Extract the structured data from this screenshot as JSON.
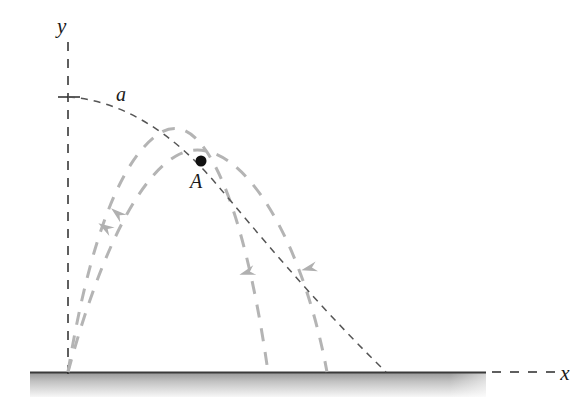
{
  "figure": {
    "kind": "projectile-envelope-diagram",
    "background_color": "#ffffff"
  },
  "axes": {
    "y_axis": {
      "label": "y",
      "style": "dashed",
      "color": "#2b2b2b",
      "x": 68,
      "y_top": 42,
      "y_bottom": 374
    },
    "x_axis": {
      "label": "x",
      "style": "dashed",
      "color": "#2b2b2b",
      "y": 372,
      "x_start": 492,
      "x_end": 556
    },
    "origin": {
      "x": 68,
      "y": 372
    },
    "tick": {
      "name": "y-axis-tick",
      "x_from": 58,
      "x_to": 80,
      "y": 97
    }
  },
  "ground": {
    "name": "ground-surface",
    "line_color": "#3a3a3a",
    "fill_top_color": "#9a9a9a",
    "fill_bottom_color": "#f2f2f2",
    "x_start": 30,
    "x_end": 486,
    "y": 372,
    "thickness": 24
  },
  "envelope_curve": {
    "label": "a",
    "label_x": 116,
    "label_y": 101,
    "color": "#555555",
    "stroke_width": 1.5,
    "dash": "7 6",
    "path": "M 68 97 C 120 100 172 131 218 186 C 254 228 310 298 386 372"
  },
  "trajectories": [
    {
      "name": "trajectory-outer",
      "color": "#b4b4b4",
      "stroke_width": 3,
      "dash": "13 11",
      "path": "M 68 372 C 88 250 118 160 160 133 C 206 104 246 215 268 372",
      "arrow_up": {
        "x": 106,
        "y": 228,
        "angle": -58
      },
      "arrow_down": {
        "x": 248,
        "y": 272,
        "angle": 73
      }
    },
    {
      "name": "trajectory-inner",
      "color": "#b4b4b4",
      "stroke_width": 3,
      "dash": "13 11",
      "path": "M 68 372 C 96 268 134 180 176 156 C 232 124 300 226 327 372",
      "arrow_up": {
        "x": 118,
        "y": 214,
        "angle": -50
      },
      "arrow_down": {
        "x": 310,
        "y": 268,
        "angle": 76
      }
    }
  ],
  "point": {
    "name": "point-a",
    "label": "A",
    "x": 201,
    "y": 161,
    "radius": 5.5,
    "color": "#111111",
    "label_x": 190,
    "label_y": 188
  },
  "chart_data": {
    "type": "line",
    "title": "",
    "xlabel": "x",
    "ylabel": "y",
    "annotations": [
      "a",
      "A"
    ],
    "series": [
      {
        "name": "a",
        "role": "envelope-of-trajectories"
      },
      {
        "name": "trajectory-outer",
        "role": "projectile-path"
      },
      {
        "name": "trajectory-inner",
        "role": "projectile-path"
      }
    ]
  }
}
